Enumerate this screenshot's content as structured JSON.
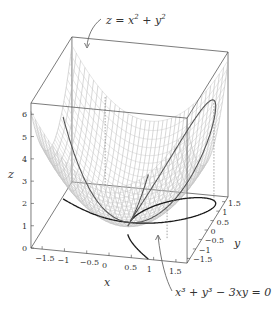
{
  "chart_data": {
    "type": "surface3d",
    "title": "",
    "surface": {
      "equation": "z = x^2 + y^2",
      "label": "z = x² + y²",
      "style": "wireframe mesh, light gray",
      "x_range": [
        -1.75,
        1.75
      ],
      "y_range": [
        -1.75,
        1.75
      ]
    },
    "curves": [
      {
        "name": "folium_of_descartes_plane",
        "equation": "x^3 + y^3 - 3xy = 0",
        "label": "x³ + y³ − 3xy = 0",
        "location": "z = 0 plane",
        "color": "#222222"
      },
      {
        "name": "folium_on_surface",
        "description": "folium lifted onto paraboloid",
        "color": "#444444"
      }
    ],
    "axes": {
      "x": {
        "label": "x",
        "range": [
          -1.75,
          1.75
        ],
        "ticks": [
          -1.5,
          -1,
          -0.5,
          0,
          0.5,
          1,
          1.5
        ],
        "tick_labels": [
          "−1.5",
          "−1",
          "−0.5",
          "0",
          "0.5",
          "1",
          "1.5"
        ]
      },
      "y": {
        "label": "y",
        "range": [
          -1.75,
          1.75
        ],
        "ticks": [
          -1.5,
          -1,
          -0.5,
          0,
          0.5,
          1,
          1.5
        ],
        "tick_labels": [
          "−1.5",
          "−1",
          "−0.5",
          "0",
          "0.5",
          "1",
          "1.5"
        ]
      },
      "z": {
        "label": "z",
        "range": [
          0,
          6.5
        ],
        "ticks": [
          0,
          1,
          2,
          3,
          4,
          5,
          6
        ],
        "tick_labels": [
          "0",
          "1",
          "2",
          "3",
          "4",
          "5",
          "6"
        ]
      }
    },
    "annotations": [
      {
        "text": "z = x² + y²",
        "points_to": "surface"
      },
      {
        "text": "x³ + y³ − 3xy = 0",
        "points_to": "planar curve"
      }
    ],
    "box": true,
    "grid": false,
    "legend": "none"
  },
  "labels": {
    "surface_label_z": "z",
    "surface_label_eq": " = ",
    "surface_label_x": "x",
    "surface_label_plus": " + ",
    "surface_label_y": "y",
    "surface_exp": "2",
    "curve_label_main": "x³ + y³ − 3xy = 0",
    "x_axis": "x",
    "y_axis": "y",
    "z_axis": "z"
  }
}
